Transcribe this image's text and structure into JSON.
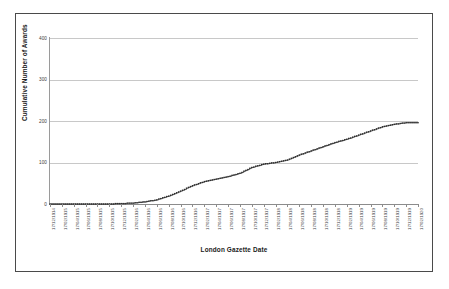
{
  "chart_data": {
    "type": "line",
    "title": "",
    "xlabel": "London Gazette Date",
    "ylabel": "Cumulative Number of Awards",
    "ylim": [
      0,
      400
    ],
    "yticks": [
      0,
      100,
      200,
      300,
      400
    ],
    "ytick_labels": [
      "0",
      "100",
      "200",
      "300",
      "400"
    ],
    "grid": true,
    "legend": "none",
    "marker": "square",
    "line_color": "#2b2b2b",
    "grid_color": "#c8c8c8",
    "axis_color": "#8c8c8c",
    "categories": [
      "17/12/1914",
      "17/02/1915",
      "17/04/1915",
      "17/06/1915",
      "17/08/1915",
      "17/10/1915",
      "17/12/1915",
      "17/02/1916",
      "17/04/1916",
      "17/06/1916",
      "17/08/1916",
      "17/10/1916",
      "17/12/1916",
      "17/02/1917",
      "17/04/1917",
      "17/06/1917",
      "17/08/1917",
      "17/10/1917",
      "17/12/1917",
      "17/02/1918",
      "17/04/1918",
      "17/06/1918",
      "17/08/1918",
      "17/10/1918",
      "17/12/1918",
      "17/02/1919",
      "17/04/1919",
      "17/06/1919",
      "17/08/1919",
      "17/10/1919",
      "17/12/1919",
      "17/02/1920"
    ],
    "series": [
      {
        "name": "Cumulative Awards",
        "values": [
          0,
          0,
          0,
          0,
          0,
          0,
          1,
          2,
          5,
          10,
          19,
          31,
          44,
          54,
          60,
          66,
          74,
          88,
          96,
          100,
          106,
          118,
          128,
          138,
          148,
          156,
          166,
          176,
          186,
          192,
          196,
          196
        ]
      }
    ]
  }
}
